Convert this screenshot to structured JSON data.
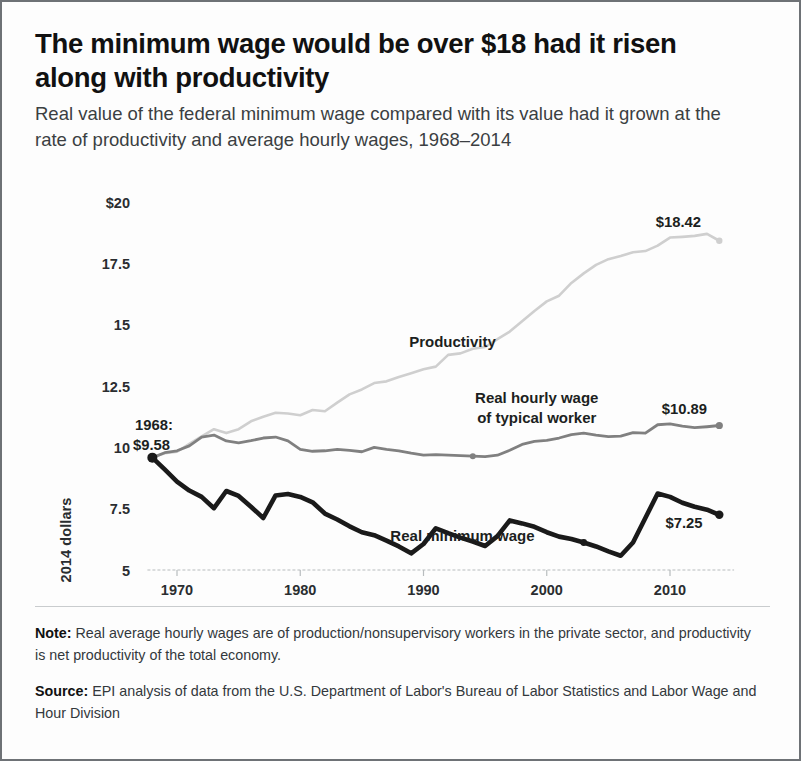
{
  "title": "The minimum wage would be over $18 had it risen along with productivity",
  "subtitle": "Real value of the federal minimum wage compared with its value had it grown at the rate of productivity and average hourly wages, 1968–2014",
  "footer": {
    "note_lead": "Note:",
    "note_text": " Real average hourly wages are of production/nonsupervisory workers in the private sector, and productivity is net productivity of the total economy.",
    "source_lead": "Source:",
    "source_text": " EPI analysis of data from the U.S. Department of Labor's Bureau of Labor Statistics and Labor Wage and Hour Division"
  },
  "colors": {
    "minimum_wage": "#1a1a1a",
    "hourly_wage": "#808080",
    "productivity": "#cfcfcf",
    "axis": "#b8bcbe",
    "text": "#1a1a1a"
  },
  "chart_data": {
    "type": "line",
    "title": "The minimum wage would be over $18 had it risen along with productivity",
    "xlabel": "",
    "ylabel": "2014 dollars",
    "xlim": [
      1967,
      2015
    ],
    "ylim": [
      5,
      20
    ],
    "grid": false,
    "legend": "inline annotations",
    "x_ticks": [
      1970,
      1980,
      1990,
      2000,
      2010
    ],
    "x_tick_labels": [
      "1970",
      "1980",
      "1990",
      "2000",
      "2010"
    ],
    "y_ticks": [
      5,
      7.5,
      10,
      12.5,
      15,
      17.5,
      20
    ],
    "y_tick_labels": [
      "5",
      "7.5",
      "10",
      "12.5",
      "15",
      "17.5",
      "$20"
    ],
    "annotations": [
      {
        "id": "start-value",
        "text_line1": "1968:",
        "text_line2": "$9.58",
        "x": 1968,
        "y": 9.58
      },
      {
        "id": "productivity-label",
        "text": "Productivity",
        "x": 1993,
        "y": 14.1
      },
      {
        "id": "productivity-end",
        "text": "$18.42",
        "x": 2011,
        "y": 19.0
      },
      {
        "id": "hourly-wage-label",
        "text_line1": "Real hourly wage",
        "text_line2": "of typical worker",
        "x": 2000,
        "y": 11.9
      },
      {
        "id": "hourly-wage-end",
        "text": "$10.89",
        "x": 2011,
        "y": 11.35
      },
      {
        "id": "minimum-wage-label",
        "text": "Real minimum wage",
        "x": 1993,
        "y": 6.2
      },
      {
        "id": "minimum-wage-end",
        "text": "$7.25",
        "x": 2010,
        "y": 6.7
      }
    ],
    "series": [
      {
        "name": "Productivity",
        "color": "#cfcfcf",
        "end_label": "$18.42",
        "end_value": 18.42,
        "x": [
          1968,
          1969,
          1970,
          1971,
          1972,
          1973,
          1974,
          1975,
          1976,
          1977,
          1978,
          1979,
          1980,
          1981,
          1982,
          1983,
          1984,
          1985,
          1986,
          1987,
          1988,
          1989,
          1990,
          1991,
          1992,
          1993,
          1994,
          1995,
          1996,
          1997,
          1998,
          1999,
          2000,
          2001,
          2002,
          2003,
          2004,
          2005,
          2006,
          2007,
          2008,
          2009,
          2010,
          2011,
          2012,
          2013,
          2014
        ],
        "values": [
          9.58,
          9.76,
          9.82,
          10.14,
          10.45,
          10.74,
          10.58,
          10.74,
          11.06,
          11.25,
          11.41,
          11.38,
          11.31,
          11.52,
          11.47,
          11.82,
          12.16,
          12.36,
          12.62,
          12.69,
          12.87,
          13.02,
          13.18,
          13.29,
          13.77,
          13.83,
          14.02,
          14.09,
          14.41,
          14.72,
          15.14,
          15.56,
          15.95,
          16.18,
          16.7,
          17.09,
          17.44,
          17.67,
          17.8,
          17.95,
          18.0,
          18.22,
          18.55,
          18.58,
          18.62,
          18.7,
          18.42
        ]
      },
      {
        "name": "Real hourly wage of typical worker",
        "color": "#808080",
        "end_label": "$10.89",
        "end_value": 10.89,
        "x": [
          1968,
          1969,
          1970,
          1971,
          1972,
          1973,
          1974,
          1975,
          1976,
          1977,
          1978,
          1979,
          1980,
          1981,
          1982,
          1983,
          1984,
          1985,
          1986,
          1987,
          1988,
          1989,
          1990,
          1991,
          1992,
          1993,
          1994,
          1995,
          1996,
          1997,
          1998,
          1999,
          2000,
          2001,
          2002,
          2003,
          2004,
          2005,
          2006,
          2007,
          2008,
          2009,
          2010,
          2011,
          2012,
          2013,
          2014
        ],
        "values": [
          9.58,
          9.78,
          9.86,
          10.06,
          10.42,
          10.5,
          10.26,
          10.18,
          10.27,
          10.38,
          10.42,
          10.26,
          9.92,
          9.84,
          9.86,
          9.92,
          9.88,
          9.82,
          10.0,
          9.92,
          9.86,
          9.76,
          9.68,
          9.7,
          9.68,
          9.66,
          9.64,
          9.62,
          9.68,
          9.88,
          10.12,
          10.24,
          10.28,
          10.38,
          10.52,
          10.58,
          10.5,
          10.44,
          10.46,
          10.6,
          10.58,
          10.92,
          10.96,
          10.86,
          10.8,
          10.84,
          10.89
        ]
      },
      {
        "name": "Real minimum wage",
        "color": "#1a1a1a",
        "end_label": "$7.25",
        "end_value": 7.25,
        "start_label": "$9.58",
        "start_value": 9.58,
        "x": [
          1968,
          1969,
          1970,
          1971,
          1972,
          1973,
          1974,
          1975,
          1976,
          1977,
          1978,
          1979,
          1980,
          1981,
          1982,
          1983,
          1984,
          1985,
          1986,
          1987,
          1988,
          1989,
          1990,
          1991,
          1992,
          1993,
          1994,
          1995,
          1996,
          1997,
          1998,
          1999,
          2000,
          2001,
          2002,
          2003,
          2004,
          2005,
          2006,
          2007,
          2008,
          2009,
          2010,
          2011,
          2012,
          2013,
          2014
        ],
        "values": [
          9.58,
          9.1,
          8.6,
          8.24,
          7.98,
          7.52,
          8.22,
          8.02,
          7.58,
          7.12,
          8.04,
          8.1,
          7.98,
          7.76,
          7.3,
          7.06,
          6.78,
          6.54,
          6.42,
          6.2,
          5.96,
          5.68,
          6.06,
          6.7,
          6.5,
          6.32,
          6.16,
          5.98,
          6.38,
          7.02,
          6.9,
          6.76,
          6.54,
          6.36,
          6.26,
          6.12,
          5.96,
          5.76,
          5.58,
          6.12,
          7.12,
          8.12,
          7.98,
          7.74,
          7.58,
          7.46,
          7.25
        ]
      }
    ]
  }
}
